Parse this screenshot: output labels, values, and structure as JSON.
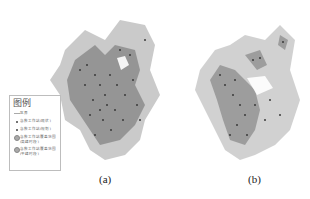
{
  "figure": {
    "panels": [
      {
        "id": "a",
        "caption": "(a)"
      },
      {
        "id": "b",
        "caption": "(b)"
      }
    ],
    "legend": {
      "title": "图例",
      "items": [
        {
          "symbol": "line",
          "label": "区界"
        },
        {
          "symbol": "dot",
          "label": "急救工作站(现状)"
        },
        {
          "symbol": "dot",
          "label": "急救工作站(规划)"
        },
        {
          "symbol": "area",
          "label": "急救工作站覆盖范围\n(高峰时段)"
        },
        {
          "symbol": "area",
          "label": "急救工作站覆盖范围\n(平峰时段)"
        }
      ]
    },
    "colors": {
      "coverage_fill": "#8c8c8c",
      "coverage_light": "#bdbdbd",
      "station_dot": "#3a3a3a",
      "legend_border": "#bdbdbd"
    }
  }
}
